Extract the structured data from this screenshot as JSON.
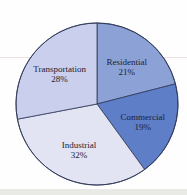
{
  "chart_data": {
    "type": "pie",
    "title": "",
    "categories": [
      "Residential",
      "Commercial",
      "Industrial",
      "Transportation"
    ],
    "values": [
      21,
      19,
      32,
      28
    ],
    "slice_labels": [
      "Residential 21%",
      "Commercial 19%",
      "Industrial 32%",
      "Transportation 28%"
    ],
    "colors": [
      "#8ca2d6",
      "#5f7ec8",
      "#e2e4f3",
      "#c9cfec"
    ],
    "outline_color": "#2f3856",
    "label_color": "#1b2135",
    "start_angle_deg": 0,
    "direction": "clockwise",
    "legend": "none",
    "center": {
      "x": 97,
      "y": 104
    },
    "radius": 81,
    "label_radius_fraction": 0.6
  }
}
